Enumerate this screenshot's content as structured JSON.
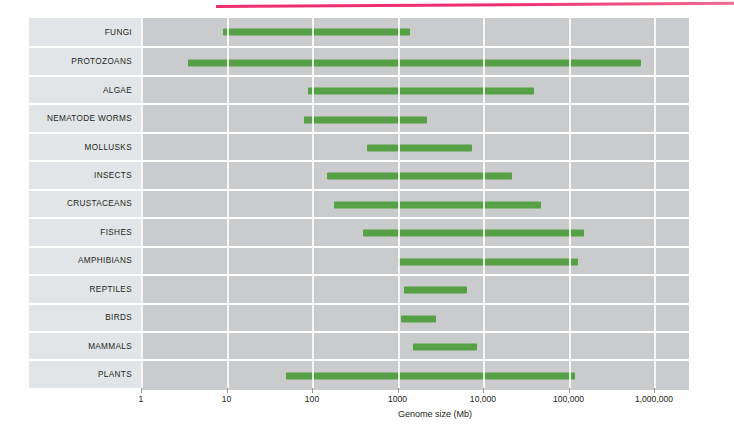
{
  "figure": {
    "top_rule_color": "#ef2f6e",
    "bar_color": "#56a046",
    "track_color": "#c9cbcc",
    "label_color": "#e2e5e7"
  },
  "chart_data": {
    "type": "bar",
    "orientation": "horizontal-range",
    "title": "",
    "xlabel": "Genome size (Mb)",
    "ylabel": "",
    "xscale": "log",
    "xlim": [
      1,
      3000000
    ],
    "grid": true,
    "legend": "none",
    "tick_labels": [
      "1",
      "10",
      "100",
      "1000",
      "10,000",
      "100,000",
      "1,000,000"
    ],
    "tick_values": [
      1,
      10,
      100,
      1000,
      10000,
      100000,
      1000000
    ],
    "categories": [
      "FUNGI",
      "PROTOZOANS",
      "ALGAE",
      "NEMATODE WORMS",
      "MOLLUSKS",
      "INSECTS",
      "CRUSTACEANS",
      "FISHES",
      "AMPHIBIANS",
      "REPTILES",
      "BIRDS",
      "MAMMALS",
      "PLANTS"
    ],
    "ranges": [
      {
        "category": "FUNGI",
        "min": 9,
        "max": 1400
      },
      {
        "category": "PROTOZOANS",
        "min": 3.5,
        "max": 700000
      },
      {
        "category": "ALGAE",
        "min": 90,
        "max": 40000
      },
      {
        "category": "NEMATODE WORMS",
        "min": 80,
        "max": 2200
      },
      {
        "category": "MOLLUSKS",
        "min": 440,
        "max": 7500
      },
      {
        "category": "INSECTS",
        "min": 150,
        "max": 22000
      },
      {
        "category": "CRUSTACEANS",
        "min": 180,
        "max": 48000
      },
      {
        "category": "FISHES",
        "min": 400,
        "max": 150000
      },
      {
        "category": "AMPHIBIANS",
        "min": 1000,
        "max": 130000
      },
      {
        "category": "REPTILES",
        "min": 1200,
        "max": 6500
      },
      {
        "category": "BIRDS",
        "min": 1100,
        "max": 2800
      },
      {
        "category": "MAMMALS",
        "min": 1500,
        "max": 8500
      },
      {
        "category": "PLANTS",
        "min": 50,
        "max": 120000
      }
    ]
  }
}
